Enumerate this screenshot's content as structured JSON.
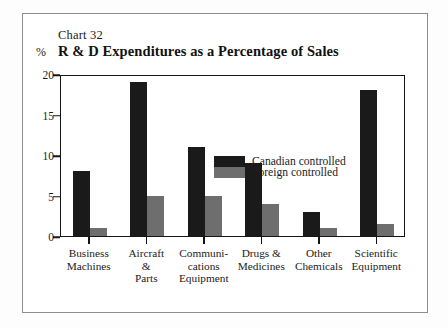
{
  "chart_number": "Chart 32",
  "percent_symbol": "%",
  "title": "R & D Expenditures as a Percentage of Sales",
  "legend": {
    "position": "inside-top-left",
    "entries": [
      {
        "name": "Canadian controlled",
        "color": "#1a1a1a",
        "key": "canadian"
      },
      {
        "name": "Foreign controlled",
        "color": "#6e6e6e",
        "key": "foreign"
      }
    ]
  },
  "chart_data": {
    "type": "bar",
    "title": "R & D Expenditures as a Percentage of Sales",
    "xlabel": "",
    "ylabel": "%",
    "ylim": [
      0,
      20
    ],
    "yticks": [
      0,
      5,
      10,
      15,
      20
    ],
    "grid": false,
    "categories": [
      "Business Machines",
      "Aircraft & Parts",
      "Communications Equipment",
      "Drugs & Medicines",
      "Other Chemicals",
      "Scientific Equipment"
    ],
    "category_label_lines": [
      [
        "Business",
        "Machines"
      ],
      [
        "Aircraft",
        "&",
        "Parts"
      ],
      [
        "Communi-",
        "cations",
        "Equipment"
      ],
      [
        "Drugs &",
        "Medicines"
      ],
      [
        "Other",
        "Chemicals"
      ],
      [
        "Scientific",
        "Equipment"
      ]
    ],
    "series": [
      {
        "name": "Canadian controlled",
        "color": "#1a1a1a",
        "values": [
          8,
          19,
          11,
          9,
          3,
          18
        ]
      },
      {
        "name": "Foreign controlled",
        "color": "#6e6e6e",
        "values": [
          1,
          5,
          5,
          4,
          1,
          1.5
        ]
      }
    ]
  }
}
